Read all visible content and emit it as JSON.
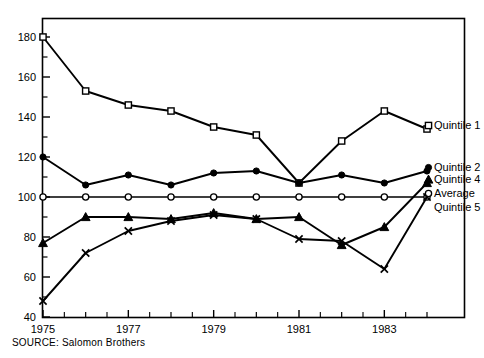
{
  "source_note": "SOURCE: Salomon Brothers",
  "chart_data": {
    "type": "line",
    "title": "",
    "subtitle": "",
    "xlabel": "",
    "ylabel": "",
    "xlim": [
      1975,
      1984
    ],
    "ylim": [
      40,
      185
    ],
    "grid": false,
    "legend_position": "right-inline",
    "x": [
      1975,
      1976,
      1977,
      1978,
      1979,
      1980,
      1981,
      1982,
      1983,
      1984
    ],
    "x_tick_labels": [
      "1975",
      "1977",
      "1979",
      "1981",
      "1983"
    ],
    "x_tick_values": [
      1975,
      1977,
      1979,
      1981,
      1983
    ],
    "x_minor_ticks": [
      1976,
      1978,
      1980,
      1982,
      1984
    ],
    "y_tick_labels": [
      "40",
      "60",
      "80",
      "100",
      "120",
      "140",
      "160",
      "180"
    ],
    "y_tick_values": [
      40,
      60,
      80,
      100,
      120,
      140,
      160,
      180
    ],
    "y_minor_ticks": [
      50,
      70,
      90,
      110,
      130,
      150,
      170
    ],
    "series": [
      {
        "name": "Quintile 1",
        "marker": "open-square",
        "color": "#000000",
        "values": [
          180,
          153,
          146,
          143,
          135,
          131,
          107,
          128,
          143,
          134
        ]
      },
      {
        "name": "Quintile 2",
        "marker": "filled-circle",
        "color": "#000000",
        "values": [
          120,
          106,
          111,
          106,
          112,
          113,
          107,
          111,
          107,
          113
        ]
      },
      {
        "name": "Average",
        "marker": "open-circle",
        "color": "#000000",
        "values": [
          100,
          100,
          100,
          100,
          100,
          100,
          100,
          100,
          100,
          100
        ]
      },
      {
        "name": "Quintile 4",
        "marker": "filled-triangle",
        "color": "#000000",
        "values": [
          77,
          90,
          90,
          89,
          92,
          89,
          90,
          76,
          85,
          107
        ]
      },
      {
        "name": "Quintile 5",
        "marker": "x-cross",
        "color": "#000000",
        "values": [
          48,
          72,
          83,
          88,
          91,
          89,
          79,
          78,
          64,
          100
        ]
      }
    ],
    "legend_entries": [
      {
        "label": "Quintile 1",
        "marker": "open-square",
        "anchor_value": 134
      },
      {
        "label": "Quintile 2",
        "marker": "filled-circle",
        "anchor_value": 113
      },
      {
        "label": "Quintile 4",
        "marker": "filled-triangle",
        "anchor_value": 107
      },
      {
        "label": "Average",
        "marker": "open-circle",
        "anchor_value": 100
      },
      {
        "label": "Quintile 5",
        "marker": "none",
        "anchor_value": 93
      }
    ]
  }
}
